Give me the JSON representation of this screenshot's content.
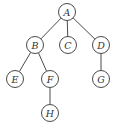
{
  "diagram": {
    "type": "tree",
    "title": "",
    "nodes": [
      {
        "id": "A",
        "label": "A",
        "x": 67,
        "y": 12
      },
      {
        "id": "B",
        "label": "B",
        "x": 35,
        "y": 45
      },
      {
        "id": "C",
        "label": "C",
        "x": 68,
        "y": 45
      },
      {
        "id": "D",
        "label": "D",
        "x": 101,
        "y": 45
      },
      {
        "id": "E",
        "label": "E",
        "x": 15,
        "y": 79
      },
      {
        "id": "F",
        "label": "F",
        "x": 50,
        "y": 79
      },
      {
        "id": "G",
        "label": "G",
        "x": 101,
        "y": 79
      },
      {
        "id": "H",
        "label": "H",
        "x": 50,
        "y": 113
      }
    ],
    "edges": [
      {
        "from": "A",
        "to": "B"
      },
      {
        "from": "A",
        "to": "C"
      },
      {
        "from": "A",
        "to": "D"
      },
      {
        "from": "B",
        "to": "E"
      },
      {
        "from": "B",
        "to": "F"
      },
      {
        "from": "D",
        "to": "G"
      },
      {
        "from": "F",
        "to": "H"
      }
    ],
    "node_radius": 8.5,
    "colors": {
      "stroke": "#4a4a4a",
      "text": "#333333",
      "background": "#ffffff"
    }
  }
}
